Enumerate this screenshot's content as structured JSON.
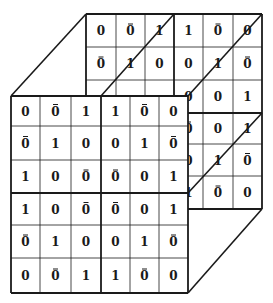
{
  "diagram": {
    "type": "3d-stacked-matrix",
    "colors": {
      "line": "#1a1a1a",
      "background": "#ffffff"
    },
    "matrix_legend": {
      "0": "0",
      "1": "1",
      "0b": "0 with overbar (complement)"
    },
    "front_face": {
      "rows": [
        [
          "0",
          "0b",
          "1",
          "1",
          "0b",
          "0"
        ],
        [
          "0b",
          "1",
          "0",
          "0",
          "1",
          "0b"
        ],
        [
          "1",
          "0",
          "0b",
          "0b",
          "0",
          "1"
        ],
        [
          "1",
          "0",
          "0b",
          "0b",
          "0",
          "1"
        ],
        [
          "0b",
          "1",
          "0",
          "0",
          "1",
          "0b"
        ],
        [
          "0",
          "0b",
          "1",
          "1",
          "0b",
          "0"
        ]
      ]
    },
    "back_face": {
      "rows": [
        [
          "0",
          "0b",
          "1",
          "1",
          "0b",
          "0"
        ],
        [
          "0b",
          "1",
          "0",
          "0",
          "1",
          "0b"
        ],
        [
          "1",
          "0",
          "0b",
          "0",
          "0",
          "1"
        ],
        [
          "1",
          "0",
          "0b",
          "0b",
          "0",
          "1"
        ],
        [
          "0b",
          "1",
          "0",
          "0",
          "1",
          "0b"
        ],
        [
          "0",
          "0b",
          "1",
          "1",
          "0b",
          "0"
        ]
      ]
    }
  }
}
